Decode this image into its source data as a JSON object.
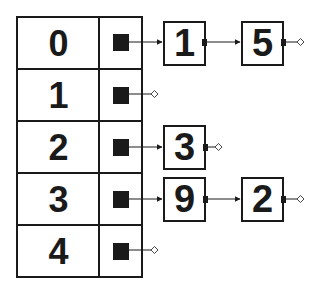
{
  "diagram": {
    "type": "hash-table-chaining",
    "colors": {
      "stroke": "#1a1a1a",
      "background": "#ffffff"
    },
    "buckets": [
      {
        "index": "0",
        "chain": [
          "1",
          "5"
        ]
      },
      {
        "index": "1",
        "chain": []
      },
      {
        "index": "2",
        "chain": [
          "3"
        ]
      },
      {
        "index": "3",
        "chain": [
          "9",
          "2"
        ]
      },
      {
        "index": "4",
        "chain": []
      }
    ],
    "null_marker": "diamond"
  }
}
